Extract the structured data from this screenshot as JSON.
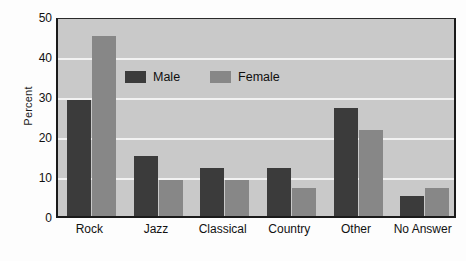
{
  "chart_data": {
    "type": "bar",
    "title": "",
    "xlabel": "",
    "ylabel": "Percent",
    "ylim": [
      0,
      50
    ],
    "yticks": [
      0,
      10,
      20,
      30,
      40,
      50
    ],
    "grid": true,
    "gridlines_at": [
      10,
      20,
      30,
      40
    ],
    "legend_position": "inside-top-left",
    "categories": [
      "Rock",
      "Jazz",
      "Classical",
      "Country",
      "Other",
      "No Answer"
    ],
    "series": [
      {
        "name": "Male",
        "color": "#3b3b3b",
        "values": [
          29,
          15,
          12,
          12,
          27,
          5
        ]
      },
      {
        "name": "Female",
        "color": "#878787",
        "values": [
          45,
          9,
          9,
          7,
          21.5,
          7
        ]
      }
    ]
  },
  "axes": {
    "y_title": "Percent",
    "y_tick_labels": [
      "50",
      "40",
      "30",
      "20",
      "10",
      "0"
    ],
    "x_tick_labels": [
      "Rock",
      "Jazz",
      "Classical",
      "Country",
      "Other",
      "No Answer"
    ]
  },
  "legend": {
    "entries": [
      {
        "label": "Male",
        "swatch": "male-swatch"
      },
      {
        "label": "Female",
        "swatch": "female-swatch"
      }
    ]
  },
  "colors": {
    "male": "#3b3b3b",
    "female": "#878787",
    "plot_background": "#c9c9c9",
    "gridline": "#f2f2f2",
    "axis": "#1a1a1a",
    "page_background": "#fdfdfd"
  }
}
